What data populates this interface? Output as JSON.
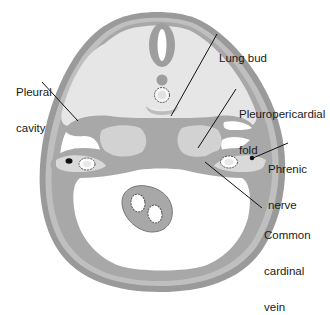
{
  "figure": {
    "colors": {
      "background": "#ffffff",
      "outer_wall": "#9a9a9a",
      "body_fill": "#e6e6e6",
      "dark_tissue": "#a8a8a8",
      "lung_bud": "#d2d2d2",
      "cavity": "#ffffff",
      "outline": "#7a7a7a",
      "leader_line": "#111111",
      "nerve_dot": "#111111"
    }
  },
  "labels": {
    "lung_bud": [
      "Lung bud"
    ],
    "pleural_cavity": [
      "Pleural",
      "cavity"
    ],
    "pleuropericardial_fold": [
      "Pleuropericardial",
      "fold"
    ],
    "phrenic_nerve": [
      "Phrenic",
      "nerve"
    ],
    "common_cardinal_vein": [
      "Common",
      "cardinal",
      "vein"
    ]
  }
}
